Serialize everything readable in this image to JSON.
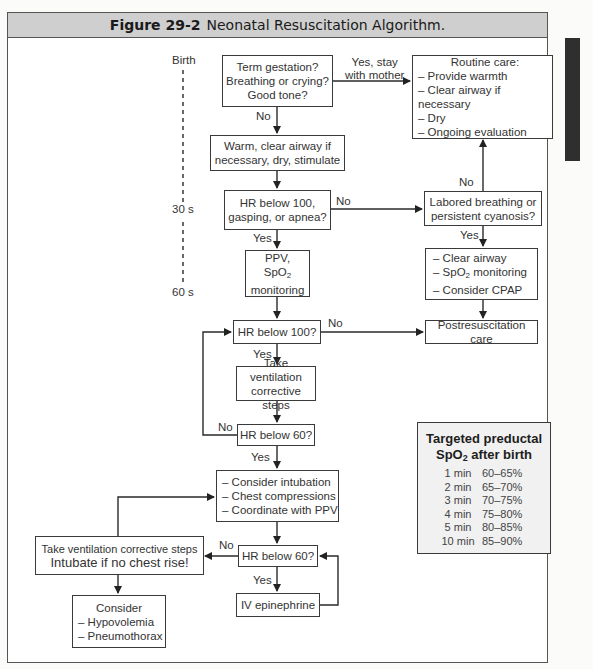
{
  "figure": {
    "number_label": "Figure 29-2",
    "title": "Neonatal Resuscitation Algorithm."
  },
  "timeline": {
    "birth": "Birth",
    "t30": "30 s",
    "t60": "60 s"
  },
  "nodes": {
    "assess": [
      "Term gestation?",
      "Breathing or crying?",
      "Good tone?"
    ],
    "routine_care": {
      "title": "Routine care:",
      "items": [
        "– Provide warmth",
        "– Clear airway if necessary",
        "– Dry",
        "– Ongoing evaluation"
      ]
    },
    "warm": [
      "Warm, clear airway if",
      "necessary, dry, stimulate"
    ],
    "hr100_gasp": [
      "HR below 100,",
      "gasping, or apnea?"
    ],
    "labored": [
      "Labored breathing or",
      "persistent cyanosis?"
    ],
    "ppv": {
      "line1": "PPV,",
      "spo2_base": "SpO",
      "spo2_sub": "2",
      "line3": "monitoring"
    },
    "clear_airway": {
      "item1": "– Clear airway",
      "item2_prefix": "– SpO",
      "item2_sub": "2",
      "item2_suffix": " monitoring",
      "item3": "– Consider CPAP"
    },
    "hr100": "HR below 100?",
    "postresus": "Postresuscitation care",
    "ventilation": [
      "Take ventilation",
      "corrective steps"
    ],
    "hr60_a": "HR below 60?",
    "intubation": [
      "– Consider intubation",
      "– Chest compressions",
      "– Coordinate with PPV"
    ],
    "ventilation_left": {
      "line1": "Take ventilation corrective steps",
      "line2": "Intubate if no chest rise!"
    },
    "hr60_b": "HR below 60?",
    "consider": [
      "Consider",
      "– Hypovolemia",
      "– Pneumothorax"
    ],
    "epinephrine": "IV epinephrine"
  },
  "edge_labels": {
    "yes_stay": [
      "Yes, stay",
      "with mother"
    ],
    "no_1": "No",
    "no_2": "No",
    "no_3": "No",
    "yes_1": "Yes",
    "yes_2": "Yes",
    "no_4": "No",
    "yes_3": "Yes",
    "no_5": "No",
    "yes_4": "Yes",
    "no_6": "No",
    "yes_5": "Yes"
  },
  "spo2_table": {
    "title_line1": "Targeted preductal",
    "title_base": "SpO",
    "title_sub": "2",
    "title_suffix": " after birth",
    "rows": [
      {
        "time": "1 min",
        "range": "60–65%"
      },
      {
        "time": "2 min",
        "range": "65–70%"
      },
      {
        "time": "3 min",
        "range": "70–75%"
      },
      {
        "time": "4 min",
        "range": "75–80%"
      },
      {
        "time": "5 min",
        "range": "80–85%"
      },
      {
        "time": "10 min",
        "range": "85–90%"
      }
    ]
  }
}
